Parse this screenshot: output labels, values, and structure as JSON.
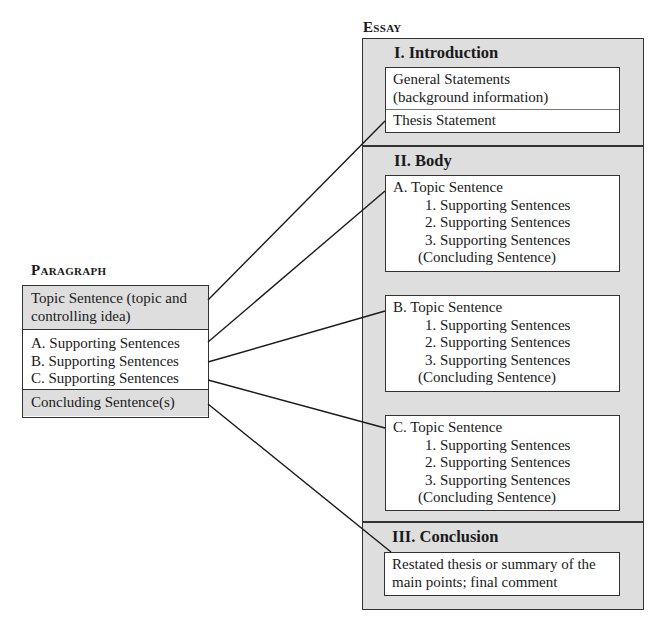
{
  "essay": {
    "label": "Essay",
    "introduction": {
      "heading": "I.  Introduction",
      "general_line1": "General Statements",
      "general_line2": "(background information)",
      "thesis": "Thesis Statement"
    },
    "body": {
      "heading": "II.  Body",
      "sections": [
        {
          "topic": "A.  Topic Sentence",
          "support": [
            "1.  Supporting Sentences",
            "2.  Supporting Sentences",
            "3.  Supporting Sentences"
          ],
          "concluding": "(Concluding Sentence)"
        },
        {
          "topic": "B.  Topic Sentence",
          "support": [
            "1.  Supporting Sentences",
            "2.  Supporting Sentences",
            "3.  Supporting Sentences"
          ],
          "concluding": "(Concluding Sentence)"
        },
        {
          "topic": "C.  Topic Sentence",
          "support": [
            "1.  Supporting Sentences",
            "2.  Supporting Sentences",
            "3.  Supporting Sentences"
          ],
          "concluding": "(Concluding Sentence)"
        }
      ]
    },
    "conclusion": {
      "heading": "III.  Conclusion",
      "line1": "Restated thesis or summary of the",
      "line2": "main points; final comment"
    }
  },
  "paragraph": {
    "label": "Paragraph",
    "topic_line1": "Topic Sentence (topic and",
    "topic_line2": "controlling idea)",
    "support": [
      "A.  Supporting Sentences",
      "B.  Supporting Sentences",
      "C.  Supporting Sentences"
    ],
    "concluding": "Concluding Sentence(s)"
  },
  "colors": {
    "panel_gray": "#dedede",
    "border": "#333333",
    "connector": "#1a1a1a"
  }
}
